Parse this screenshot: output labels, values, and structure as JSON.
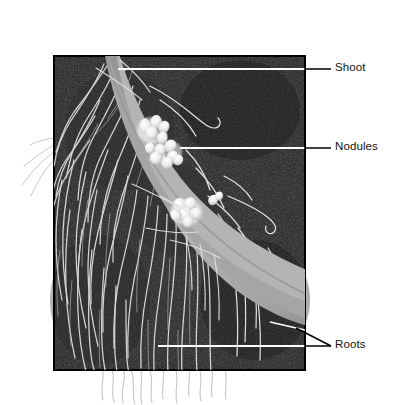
{
  "figure": {
    "type": "labeled-photograph",
    "background_color": "#ffffff",
    "photo": {
      "name": "root-system-photo",
      "x": 54,
      "y": 56,
      "width": 251,
      "height": 314,
      "fill_color": "#1d1d1d",
      "border_color": "#000000"
    },
    "plant": {
      "shoot_color": "#a8a8a8",
      "taproot_color": "#a8a8a8",
      "nodule_color": "#f2f2f2",
      "root_fiber_color": "#e8e8e8"
    }
  },
  "labels": [
    {
      "id": "shoot",
      "text": "Shoot",
      "text_color": "#141414",
      "leader_inside_color": "#ffffff",
      "leader_outside_color": "#000000",
      "leader_y": 69,
      "leader_from_x": 118,
      "leader_to_x": 330
    },
    {
      "id": "nodules",
      "text": "Nodules",
      "text_color": "#141414",
      "leader_inside_color": "#ffffff",
      "leader_outside_color": "#000000",
      "leader_y": 148,
      "leader_from_x": 180,
      "leader_to_x": 330
    },
    {
      "id": "roots",
      "text": "Roots",
      "text_color": "#141414",
      "leader_inside_color": "#ffffff",
      "leader_outside_color": "#000000",
      "leader_y": 346,
      "leader_from_x": 158,
      "leader_to_x": 330,
      "second_leader_from_x": 296,
      "second_leader_from_y": 328
    }
  ]
}
